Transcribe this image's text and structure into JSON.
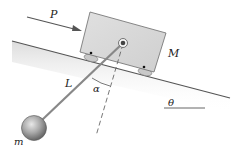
{
  "diagram": {
    "type": "mechanics",
    "labels": {
      "force": "P",
      "block_mass": "M",
      "pendulum_length": "L",
      "pendulum_angle": "α",
      "incline_angle": "θ",
      "bob_mass": "m"
    },
    "colors": {
      "block": "#d9d9d9",
      "block_edge": "#6b6b6b",
      "incline": "#555555",
      "shade": "#e6e6e6",
      "rod": "#8a8a8a",
      "bob": "#9c9c9c",
      "arrow": "#555555"
    }
  }
}
